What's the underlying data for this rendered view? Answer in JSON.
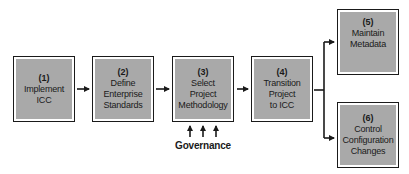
{
  "diagram": {
    "type": "flowchart",
    "colors": {
      "box_fill": "#a9a9a9",
      "border": "#1a1a1a",
      "text": "#1a1a1a",
      "background": "#ffffff"
    },
    "steps": [
      {
        "id": "1",
        "number": "(1)",
        "lines": [
          "Implement",
          "ICC"
        ]
      },
      {
        "id": "2",
        "number": "(2)",
        "lines": [
          "Define",
          "Enterprise",
          "Standards"
        ]
      },
      {
        "id": "3",
        "number": "(3)",
        "lines": [
          "Select",
          "Project",
          "Methodology"
        ]
      },
      {
        "id": "4",
        "number": "(4)",
        "lines": [
          "Transition",
          "Project",
          "to ICC"
        ]
      },
      {
        "id": "5",
        "number": "(5)",
        "lines": [
          "Maintain",
          "Metadata"
        ]
      },
      {
        "id": "6",
        "number": "(6)",
        "lines": [
          "Control",
          "Configuration",
          "Changes"
        ]
      }
    ],
    "edges": [
      {
        "from": "1",
        "to": "2"
      },
      {
        "from": "2",
        "to": "3"
      },
      {
        "from": "3",
        "to": "4"
      },
      {
        "from": "4",
        "to": "5"
      },
      {
        "from": "4",
        "to": "6"
      }
    ],
    "governance": {
      "label": "Governance",
      "arrow_count": 3,
      "target": "3"
    }
  }
}
